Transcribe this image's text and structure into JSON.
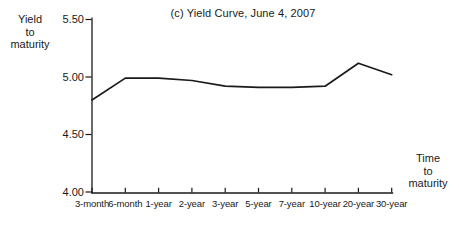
{
  "labels": {
    "y_axis": "Yield\nto\nmaturity",
    "x_axis": "Time\nto\nmaturity"
  },
  "colors": {
    "line": "#1a1a1a",
    "axis": "#1a1a1a",
    "text": "#1a1a1a",
    "background": "#ffffff"
  },
  "chart_data": {
    "type": "line",
    "title": "(c) Yield Curve, June 4, 2007",
    "xlabel": "Time to maturity",
    "ylabel": "Yield to maturity",
    "categories": [
      "3-month",
      "6-month",
      "1-year",
      "2-year",
      "3-year",
      "5-year",
      "7-year",
      "10-year",
      "20-year",
      "30-year"
    ],
    "values": [
      4.8,
      4.99,
      4.99,
      4.97,
      4.92,
      4.91,
      4.91,
      4.92,
      5.12,
      5.02
    ],
    "y_ticks": [
      5.5,
      5.0,
      4.5,
      4.0
    ],
    "y_tick_labels": [
      "5.50",
      "5.00",
      "4.50",
      "4.00"
    ],
    "ylim": [
      4.0,
      5.5
    ],
    "grid": false,
    "legend": "none"
  }
}
